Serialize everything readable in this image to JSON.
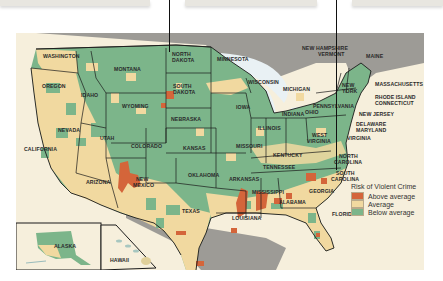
{
  "map": {
    "title": "Risk of Violent Crime",
    "colors": {
      "above": "#d4653a",
      "average": "#f1d9a0",
      "below": "#7cb58a",
      "water_land": "#9d9b96",
      "background": "#f6efdc",
      "border": "#1a1a1a"
    },
    "legend": {
      "title": "Risk of Violent Crime",
      "items": [
        {
          "label": "Above average",
          "color": "#d4653a"
        },
        {
          "label": "Average",
          "color": "#f1d9a0"
        },
        {
          "label": "Below average",
          "color": "#7cb58a"
        }
      ]
    },
    "state_labels": {
      "washington": "WASHINGTON",
      "oregon": "OREGON",
      "idaho": "IDAHO",
      "montana": "MONTANA",
      "wyoming": "WYOMING",
      "nevada": "NEVADA",
      "utah": "UTAH",
      "california": "CALIFORNIA",
      "arizona": "ARIZONA",
      "colorado": "COLORADO",
      "new_mexico_1": "NEW",
      "new_mexico_2": "MEXICO",
      "north_dakota_1": "NORTH",
      "north_dakota_2": "DAKOTA",
      "south_dakota_1": "SOUTH",
      "south_dakota_2": "DAKOTA",
      "nebraska": "NEBRASKA",
      "kansas": "KANSAS",
      "oklahoma": "OKLAHOMA",
      "texas": "TEXAS",
      "minnesota": "MINNESOTA",
      "iowa": "IOWA",
      "missouri": "MISSOURI",
      "arkansas": "ARKANSAS",
      "louisiana": "LOUISIANA",
      "wisconsin": "WISCONSIN",
      "illinois": "ILLINOIS",
      "michigan": "MICHIGAN",
      "indiana": "INDIANA",
      "ohio": "OHIO",
      "kentucky": "KENTUCKY",
      "tennessee": "TENNESSEE",
      "mississippi": "MISSISSIPPI",
      "alabama": "ALABAMA",
      "georgia": "GEORGIA",
      "florida": "FLORIDA",
      "south_carolina_1": "SOUTH",
      "south_carolina_2": "CAROLINA",
      "north_carolina_1": "NORTH",
      "north_carolina_2": "CAROLINA",
      "virginia": "VIRGINIA",
      "west_virginia_1": "WEST",
      "west_virginia_2": "VIRGINIA",
      "pennsylvania": "PENNSYLVANIA",
      "new_york_1": "NEW",
      "new_york_2": "YORK",
      "new_jersey": "NEW JERSEY",
      "delaware": "DELAWARE",
      "maryland": "MARYLAND",
      "massachusetts": "MASSACHUSETTS",
      "rhode_island": "RHODE ISLAND",
      "connecticut": "CONNECTICUT",
      "new_hampshire": "NEW HAMPSHIRE",
      "vermont": "VERMONT",
      "maine": "MAINE",
      "alaska": "ALASKA",
      "hawaii": "HAWAII"
    }
  }
}
